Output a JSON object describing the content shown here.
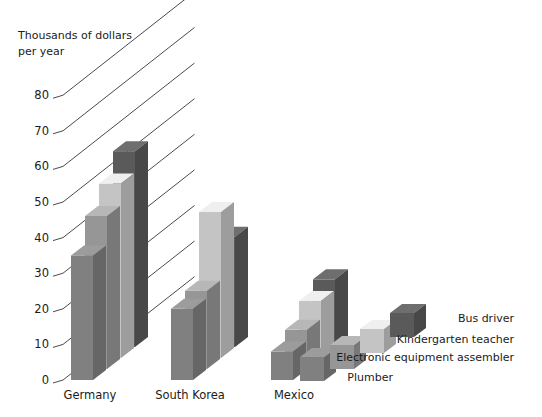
{
  "chart_data": {
    "type": "bar",
    "title": "",
    "subtitle": "",
    "xlabel": "",
    "ylabel": "Thousands of dollars per year",
    "ylabel_lines": [
      "Thousands of dollars",
      "per year"
    ],
    "categories": [
      "Germany",
      "South Korea",
      "Mexico"
    ],
    "ylim": [
      0,
      85
    ],
    "yticks": [
      0,
      10,
      20,
      30,
      40,
      50,
      60,
      70,
      80
    ],
    "ytick_labels": [
      "0",
      "10",
      "20",
      "30",
      "40",
      "50",
      "60",
      "70",
      "80"
    ],
    "grid": true,
    "grid_style": "diagonal-3d-depth-lines",
    "legend_position": "right-staggered",
    "series": [
      {
        "name": "Plumber",
        "color": "#808080",
        "values": [
          35,
          20,
          8
        ]
      },
      {
        "name": "Electronic equipment assembler",
        "color": "#969696",
        "values": [
          43,
          22,
          11
        ]
      },
      {
        "name": "Kindergarten teacher",
        "color": "#c4c4c4",
        "values": [
          49,
          41,
          16
        ]
      },
      {
        "name": "Bus driver",
        "color": "#5a5a5a",
        "values": [
          55,
          31,
          19
        ]
      }
    ]
  },
  "axis": {
    "ylabel_line1": "Thousands of dollars",
    "ylabel_line2": "per year"
  },
  "ticks": {
    "t0": "0",
    "t1": "10",
    "t2": "20",
    "t3": "30",
    "t4": "40",
    "t5": "50",
    "t6": "60",
    "t7": "70",
    "t8": "80"
  },
  "categories": {
    "c0": "Germany",
    "c1": "South Korea",
    "c2": "Mexico"
  },
  "legend": {
    "l0": "Bus driver",
    "l1": "Kindergarten teacher",
    "l2": "Electronic equipment assembler",
    "l3": "Plumber"
  }
}
